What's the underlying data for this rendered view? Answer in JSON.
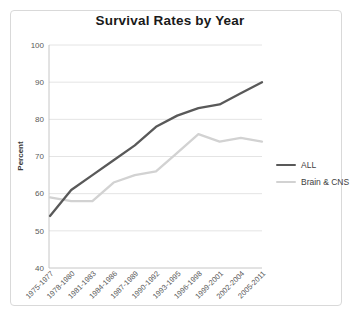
{
  "window": {
    "background": "#ffffff",
    "panel_border": "#d9d9d9"
  },
  "chart_data": {
    "type": "line",
    "title": "Survival Rates by Year",
    "xlabel": "",
    "ylabel": "Percent",
    "ylim": [
      40,
      100
    ],
    "ytick_step": 10,
    "yticks": [
      40,
      50,
      60,
      70,
      80,
      90,
      100
    ],
    "grid": "horizontal",
    "legend_position": "right",
    "colors": {
      "gridline": "#e4e4e4",
      "axis_line": "#c6c6c6",
      "tick_label": "#595959",
      "axis_title": "#3d3d3d"
    },
    "categories": [
      "1975-1977",
      "1978-1980",
      "1981-1983",
      "1984-1986",
      "1987-1989",
      "1990-1992",
      "1993-1995",
      "1996-1998",
      "1999-2001",
      "2002-2004",
      "2005-2011"
    ],
    "series": [
      {
        "name": "ALL",
        "color": "#595959",
        "values": [
          54,
          61,
          65,
          69,
          73,
          78,
          81,
          83,
          84,
          87,
          90
        ]
      },
      {
        "name": "Brain & CNS",
        "color": "#d2d2d2",
        "values": [
          59,
          58,
          58,
          63,
          65,
          66,
          71,
          76,
          74,
          75,
          74
        ]
      }
    ]
  }
}
